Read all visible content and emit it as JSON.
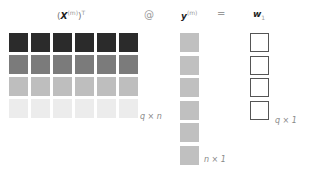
{
  "header": {
    "matrix_label": {
      "open": "(",
      "symbol": "X",
      "sup": "(m)",
      "close": ")",
      "transpose": "T"
    },
    "op_matmul": "@",
    "vector_label": {
      "symbol": "y",
      "sup": "(m)"
    },
    "op_equals": "=",
    "result_label": {
      "symbol": "w",
      "sub": "1"
    }
  },
  "matrix": {
    "rows": 4,
    "cols": 6,
    "row_colors": [
      "#2b2b2b",
      "#7b7b7b",
      "#bebebe",
      "#ececec"
    ],
    "dim_label": "q × n"
  },
  "vector_y": {
    "length": 6,
    "color": "#c0c0c0",
    "dim_label": "n × 1"
  },
  "vector_w": {
    "length": 4,
    "border_color": "#555555",
    "dim_label": "q × 1"
  }
}
